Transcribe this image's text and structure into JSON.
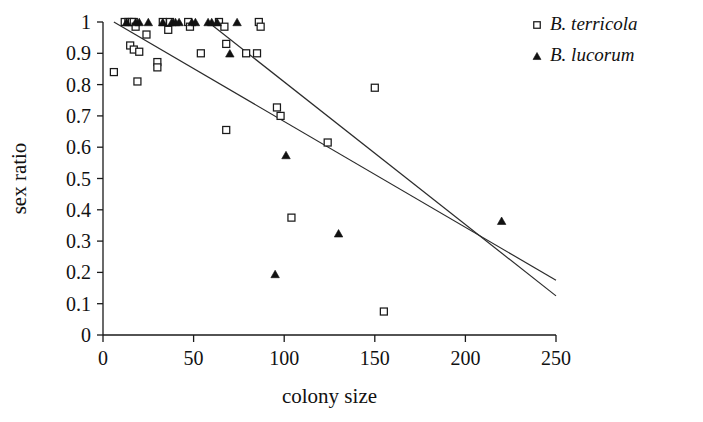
{
  "chart_data": {
    "type": "scatter",
    "title": "",
    "xlabel": "colony size",
    "ylabel": "sex ratio",
    "xlim": [
      0,
      250
    ],
    "ylim": [
      0,
      1
    ],
    "xticks": [
      0,
      50,
      100,
      150,
      200,
      250
    ],
    "yticks": [
      0,
      0.1,
      0.2,
      0.3,
      0.4,
      0.5,
      0.6,
      0.7,
      0.8,
      0.9,
      1
    ],
    "xtick_labels": [
      "0",
      "50",
      "100",
      "150",
      "200",
      "250"
    ],
    "ytick_labels": [
      "0",
      "0.1",
      "0.2",
      "0.3",
      "0.4",
      "0.5",
      "0.6",
      "0.7",
      "0.8",
      "0.9",
      "1"
    ],
    "grid": false,
    "legend_position": "top-right",
    "series": [
      {
        "name": "B. terricola",
        "marker": "open-square",
        "marker_fill": "#ffffff",
        "marker_stroke": "#1a1a1a",
        "points": [
          [
            6,
            0.84
          ],
          [
            12,
            1.0
          ],
          [
            14,
            1.0
          ],
          [
            16,
            1.0
          ],
          [
            17,
            1.0
          ],
          [
            18,
            0.985
          ],
          [
            15,
            0.925
          ],
          [
            17,
            0.912
          ],
          [
            20,
            0.905
          ],
          [
            19,
            0.81
          ],
          [
            24,
            0.96
          ],
          [
            30,
            0.872
          ],
          [
            30,
            0.855
          ],
          [
            33,
            1.0
          ],
          [
            36,
            0.975
          ],
          [
            37,
            1.0
          ],
          [
            47,
            1.0
          ],
          [
            48,
            0.985
          ],
          [
            54,
            0.9
          ],
          [
            64,
            1.0
          ],
          [
            67,
            0.985
          ],
          [
            68,
            0.93
          ],
          [
            68,
            0.655
          ],
          [
            79,
            0.9
          ],
          [
            85,
            0.9
          ],
          [
            86,
            1.0
          ],
          [
            87,
            0.985
          ],
          [
            96,
            0.727
          ],
          [
            98,
            0.7
          ],
          [
            104,
            0.375
          ],
          [
            124,
            0.615
          ],
          [
            150,
            0.79
          ],
          [
            155,
            0.075
          ]
        ]
      },
      {
        "name": "B. lucorum",
        "marker": "filled-triangle",
        "marker_fill": "#111111",
        "marker_stroke": "#111111",
        "points": [
          [
            13,
            1.0
          ],
          [
            18,
            1.0
          ],
          [
            20,
            1.0
          ],
          [
            25,
            1.0
          ],
          [
            33,
            1.0
          ],
          [
            38,
            1.0
          ],
          [
            40,
            1.0
          ],
          [
            42,
            1.0
          ],
          [
            49,
            1.0
          ],
          [
            51,
            1.0
          ],
          [
            58,
            1.0
          ],
          [
            60,
            1.0
          ],
          [
            63,
            1.0
          ],
          [
            74,
            1.0
          ],
          [
            70,
            0.9
          ],
          [
            95,
            0.195
          ],
          [
            101,
            0.575
          ],
          [
            130,
            0.325
          ],
          [
            220,
            0.365
          ]
        ]
      }
    ],
    "fit_lines": [
      {
        "name": "B. terricola regression",
        "x_start": 6,
        "y_start": 1.0,
        "x_end": 250,
        "y_end": 0.175
      },
      {
        "name": "B. lucorum regression",
        "x_start": 58,
        "y_start": 1.0,
        "x_end": 250,
        "y_end": 0.125
      }
    ]
  },
  "legend": {
    "entries": [
      {
        "label": "B. terricola",
        "marker": "open-square"
      },
      {
        "label": "B. lucorum",
        "marker": "filled-triangle"
      }
    ]
  }
}
